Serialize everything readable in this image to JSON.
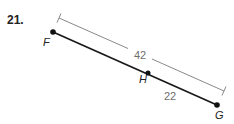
{
  "problem": {
    "number": "21."
  },
  "points": [
    {
      "name": "F",
      "x": 53,
      "y": 32,
      "label_x": 43,
      "label_y": 46
    },
    {
      "name": "H",
      "x": 148,
      "y": 73,
      "label_x": 139,
      "label_y": 83
    },
    {
      "name": "G",
      "x": 217,
      "y": 105,
      "label_x": 215,
      "label_y": 119
    }
  ],
  "measurements": {
    "FG": "42",
    "HG": "22"
  },
  "colors": {
    "segment": "#1a1a1a",
    "dimension_line": "#7a7a7a",
    "measure_text": "#6e6e6e",
    "label_text": "#222222"
  }
}
